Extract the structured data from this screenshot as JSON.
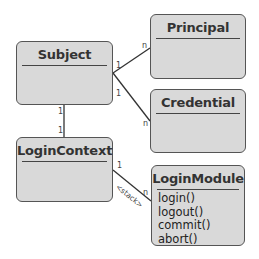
{
  "diagram": {
    "type": "UML class diagram",
    "classes": [
      {
        "id": "subject",
        "name": "Subject",
        "methods": []
      },
      {
        "id": "principal",
        "name": "Principal",
        "methods": []
      },
      {
        "id": "credential",
        "name": "Credential",
        "methods": []
      },
      {
        "id": "logincontext",
        "name": "LoginContext",
        "methods": []
      },
      {
        "id": "loginmodule",
        "name": "LoginModule",
        "methods": [
          "login()",
          "logout()",
          "commit()",
          "abort()"
        ]
      }
    ],
    "associations": [
      {
        "from": "Subject",
        "to": "Principal",
        "from_mult": "1",
        "to_mult": "n"
      },
      {
        "from": "Subject",
        "to": "Credential",
        "from_mult": "1",
        "to_mult": "n"
      },
      {
        "from": "Subject",
        "to": "LoginContext",
        "from_mult": "1",
        "to_mult": "1"
      },
      {
        "from": "LoginContext",
        "to": "LoginModule",
        "from_mult": "1",
        "to_mult": "n",
        "label": "<stack>"
      }
    ],
    "colors": {
      "box_fill": "#d9d9d9",
      "box_border": "#555555",
      "line": "#333333",
      "text": "#333333"
    }
  }
}
